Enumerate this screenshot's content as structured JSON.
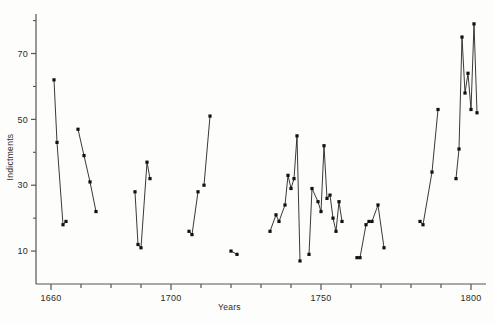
{
  "chart_data": {
    "type": "line",
    "title": "",
    "xlabel": "Years",
    "ylabel": "Indictments",
    "xlim": [
      1655,
      1805
    ],
    "ylim": [
      0,
      82
    ],
    "grid": false,
    "legend": null,
    "marker": "filled-square",
    "line_color": "#222222",
    "marker_color": "#111111",
    "axis_color": "#555555",
    "background": "#fdfdfb",
    "xticks_major": [
      1660,
      1700,
      1750,
      1800
    ],
    "xticks_major_labels": [
      "1660",
      "1700",
      "1750",
      "1800"
    ],
    "xticks_minor_step": 10,
    "yticks_major": [
      10,
      30,
      50,
      70
    ],
    "yticks_major_labels": [
      "10",
      "30",
      "50",
      "70"
    ],
    "yticks_minor": [
      20,
      40,
      60,
      80
    ],
    "note": "Broken line series: gaps indicate missing years of records",
    "segments": [
      {
        "name": "segment-1",
        "x": [
          1661,
          1662,
          1664,
          1665
        ],
        "y": [
          62,
          43,
          18,
          19
        ]
      },
      {
        "name": "segment-2",
        "x": [
          1669,
          1671,
          1673,
          1675
        ],
        "y": [
          47,
          39,
          31,
          22
        ]
      },
      {
        "name": "segment-3",
        "x": [
          1688,
          1689,
          1690,
          1692,
          1693
        ],
        "y": [
          28,
          12,
          11,
          37,
          32
        ]
      },
      {
        "name": "segment-4",
        "x": [
          1706,
          1707,
          1709
        ],
        "y": [
          16,
          15,
          28
        ]
      },
      {
        "name": "segment-5",
        "x": [
          1711,
          1713
        ],
        "y": [
          30,
          51
        ]
      },
      {
        "name": "segment-6",
        "x": [
          1720,
          1722
        ],
        "y": [
          10,
          9
        ]
      },
      {
        "name": "segment-7",
        "x": [
          1733,
          1735,
          1736,
          1738,
          1739,
          1740,
          1741,
          1742,
          1743
        ],
        "y": [
          16,
          21,
          19,
          24,
          33,
          29,
          32,
          45,
          7
        ]
      },
      {
        "name": "segment-8",
        "x": [
          1746,
          1747,
          1749,
          1750,
          1751,
          1752,
          1753,
          1754,
          1755,
          1756,
          1757
        ],
        "y": [
          9,
          29,
          25,
          22,
          42,
          26,
          27,
          20,
          16,
          25,
          19
        ]
      },
      {
        "name": "segment-9",
        "x": [
          1762,
          1763,
          1765,
          1766,
          1767,
          1769,
          1771
        ],
        "y": [
          8,
          8,
          18,
          19,
          19,
          24,
          11
        ]
      },
      {
        "name": "segment-10",
        "x": [
          1783,
          1784,
          1787,
          1789
        ],
        "y": [
          19,
          18,
          34,
          53
        ]
      },
      {
        "name": "segment-11",
        "x": [
          1795,
          1796,
          1797,
          1798,
          1799,
          1800,
          1801,
          1802
        ],
        "y": [
          32,
          41,
          75,
          58,
          64,
          53,
          79,
          52
        ]
      }
    ]
  },
  "axes": {
    "x_axis_name": "years-axis",
    "y_axis_name": "indictments-axis"
  }
}
